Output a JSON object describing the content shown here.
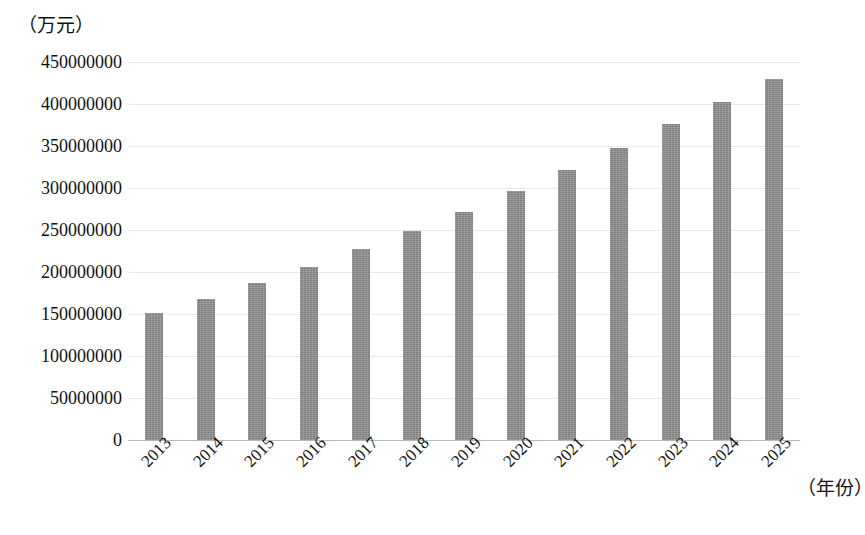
{
  "chart_data": {
    "type": "bar",
    "title": "",
    "subtitle": "",
    "xlabel": "（年份）",
    "ylabel": "（万元）",
    "categories": [
      "2013",
      "2014",
      "2015",
      "2016",
      "2017",
      "2018",
      "2019",
      "2020",
      "2021",
      "2022",
      "2023",
      "2024",
      "2025"
    ],
    "values": [
      151000000,
      168000000,
      187000000,
      206000000,
      227000000,
      249000000,
      272000000,
      297000000,
      322000000,
      348000000,
      376000000,
      402000000,
      430000000
    ],
    "ylim": [
      0,
      450000000
    ],
    "ytick_values": [
      0,
      50000000,
      100000000,
      150000000,
      200000000,
      250000000,
      300000000,
      350000000,
      400000000,
      450000000
    ],
    "ytick_labels": [
      "0",
      "50000000",
      "100000000",
      "150000000",
      "200000000",
      "250000000",
      "300000000",
      "350000000",
      "400000000",
      "450000000"
    ],
    "grid": true,
    "legend": null,
    "legend_position": "none",
    "bar_color": "#8b8b8b",
    "gridline_color": "#e9e9e9",
    "axis_color": "#b9b9b9"
  }
}
